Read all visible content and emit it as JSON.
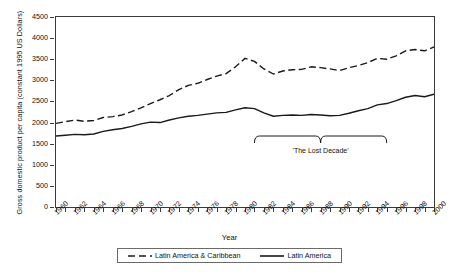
{
  "chart_data": {
    "type": "line",
    "title": "",
    "xlabel": "Year",
    "ylabel": "Gross domestic product per capita (constant 1995 US Dollars)",
    "xlim": [
      1960,
      2000
    ],
    "ylim": [
      0,
      4500
    ],
    "grid": false,
    "legend_position": "bottom",
    "yticks": [
      0,
      500,
      1000,
      1500,
      2000,
      2500,
      3000,
      3500,
      4000,
      4500
    ],
    "ytick_labels": [
      "0",
      "500",
      "1000",
      "1500",
      "2000",
      "2500",
      "3000",
      "3500",
      "4000",
      "4500"
    ],
    "xticks": [
      1960,
      1962,
      1964,
      1966,
      1968,
      1970,
      1972,
      1974,
      1976,
      1978,
      1980,
      1982,
      1984,
      1986,
      1988,
      1990,
      1992,
      1994,
      1996,
      1998,
      2000
    ],
    "xtick_labels": [
      "1960",
      "1962",
      "1964",
      "1966",
      "1968",
      "1970",
      "1972",
      "1974",
      "1976",
      "1978",
      "1980",
      "1982",
      "1984",
      "1986",
      "1988",
      "1990",
      "1992",
      "1994",
      "1996",
      "1998",
      "2000"
    ],
    "x": [
      1960,
      1961,
      1962,
      1963,
      1964,
      1965,
      1966,
      1967,
      1968,
      1969,
      1970,
      1971,
      1972,
      1973,
      1974,
      1975,
      1976,
      1977,
      1978,
      1979,
      1980,
      1981,
      1982,
      1983,
      1984,
      1985,
      1986,
      1987,
      1988,
      1989,
      1990,
      1991,
      1992,
      1993,
      1994,
      1995,
      1996,
      1997,
      1998,
      1999,
      2000
    ],
    "series": [
      {
        "name": "Latin America & Caribbean",
        "style": "dashed",
        "color": "#1a1a1a",
        "values": [
          1980,
          2020,
          2060,
          2030,
          2050,
          2120,
          2140,
          2180,
          2260,
          2350,
          2450,
          2540,
          2640,
          2780,
          2880,
          2930,
          3020,
          3100,
          3160,
          3320,
          3520,
          3450,
          3270,
          3150,
          3220,
          3250,
          3260,
          3320,
          3300,
          3270,
          3230,
          3300,
          3350,
          3420,
          3520,
          3500,
          3580,
          3700,
          3730,
          3700,
          3790
        ]
      },
      {
        "name": "Latin America",
        "style": "solid",
        "color": "#1a1a1a",
        "values": [
          1680,
          1700,
          1720,
          1710,
          1730,
          1790,
          1830,
          1860,
          1910,
          1970,
          2010,
          2000,
          2060,
          2110,
          2150,
          2170,
          2200,
          2230,
          2240,
          2300,
          2350,
          2330,
          2230,
          2150,
          2170,
          2180,
          2170,
          2190,
          2180,
          2160,
          2170,
          2220,
          2280,
          2330,
          2420,
          2450,
          2520,
          2600,
          2640,
          2610,
          2670
        ]
      }
    ],
    "annotations": [
      {
        "text": "'The Lost Decade'",
        "type": "brace",
        "x_start": 1981,
        "x_end": 1995
      }
    ]
  },
  "legend": {
    "items": [
      {
        "label": "Latin America & Caribbean",
        "style": "dashed"
      },
      {
        "label": "Latin America",
        "style": "solid"
      }
    ]
  }
}
